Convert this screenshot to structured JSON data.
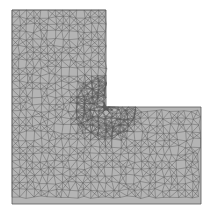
{
  "diagram": {
    "type": "triangular-mesh",
    "shape": "L-shaped domain",
    "outline": [
      [
        12,
        10
      ],
      [
        106,
        10
      ],
      [
        106,
        107
      ],
      [
        201,
        107
      ],
      [
        201,
        204
      ],
      [
        12,
        204
      ]
    ],
    "reentrant_corner": [
      106,
      107
    ],
    "colors": {
      "fill": "#b4b4b4",
      "edge": "#5a5a5a",
      "background": "#ffffff"
    }
  }
}
